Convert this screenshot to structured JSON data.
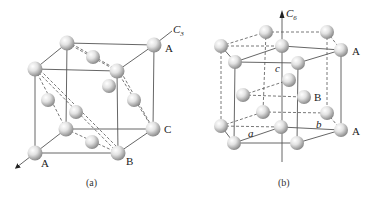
{
  "panels": [
    {
      "id": "a",
      "caption": "(a)",
      "axis_label": "C",
      "axis_subscript": "3",
      "layer_labels": {
        "top_right": "A",
        "mid_right": "C",
        "bottom_front_left": "A",
        "bottom_front_right": "B"
      },
      "structure": "face-centered cubic (ABC stacking along body diagonal)"
    },
    {
      "id": "b",
      "caption": "(b)",
      "axis_label": "C",
      "axis_subscript": "6",
      "layer_labels": {
        "top": "A",
        "middle": "B",
        "bottom": "A"
      },
      "lattice_labels": {
        "a": "a",
        "b": "b",
        "c": "c"
      },
      "structure": "hexagonal close-packed (ABAB stacking)"
    }
  ],
  "colors": {
    "line": "#555555",
    "sphere_light": "#ffffff",
    "sphere_dark": "#8a8a8a",
    "text": "#222222"
  }
}
